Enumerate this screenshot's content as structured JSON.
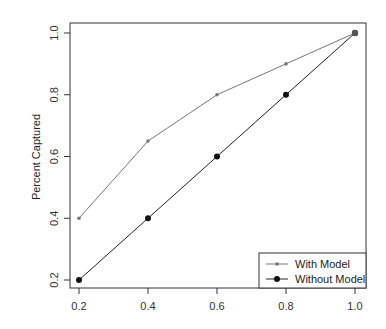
{
  "chart_data": {
    "type": "line",
    "title": "",
    "xlabel": "",
    "ylabel": "Percent Captured",
    "x": [
      0.2,
      0.4,
      0.6,
      0.8,
      1.0
    ],
    "xlim": [
      0.2,
      1.0
    ],
    "ylim": [
      0.2,
      1.0
    ],
    "xticks": [
      "0.2",
      "0.4",
      "0.6",
      "0.8",
      "1.0"
    ],
    "yticks": [
      "0.2",
      "0.4",
      "0.6",
      "0.8",
      "1.0"
    ],
    "grid": false,
    "legend_position": "bottom-right",
    "series": [
      {
        "name": "With Model",
        "values": [
          0.4,
          0.65,
          0.8,
          0.9,
          1.0
        ],
        "color": "#777777",
        "marker": "small-dot"
      },
      {
        "name": "Without Model",
        "values": [
          0.2,
          0.4,
          0.6,
          0.8,
          1.0
        ],
        "color": "#222222",
        "marker": "filled-circle"
      }
    ]
  }
}
